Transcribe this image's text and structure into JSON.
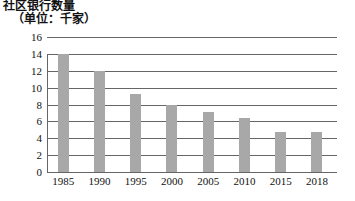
{
  "chart_data": {
    "type": "bar",
    "title": "社区银行数量",
    "subtitle": "（单位：千家）",
    "xlabel": "",
    "ylabel": "",
    "categories": [
      "1985",
      "1990",
      "1995",
      "2000",
      "2005",
      "2010",
      "2015",
      "2018"
    ],
    "values": [
      14.0,
      12.0,
      9.2,
      8.0,
      7.1,
      6.4,
      4.8,
      4.8
    ],
    "ylim": [
      0,
      16
    ],
    "yticks": [
      0,
      2,
      4,
      6,
      8,
      10,
      12,
      14,
      16
    ],
    "ytick_labels": [
      "0",
      "2",
      "4",
      "6",
      "8",
      "10",
      "12",
      "14",
      "16"
    ],
    "grid": true,
    "legend": false,
    "bar_color": "#a8a8a8",
    "grid_color": "#666666",
    "background_color": "#ffffff"
  }
}
